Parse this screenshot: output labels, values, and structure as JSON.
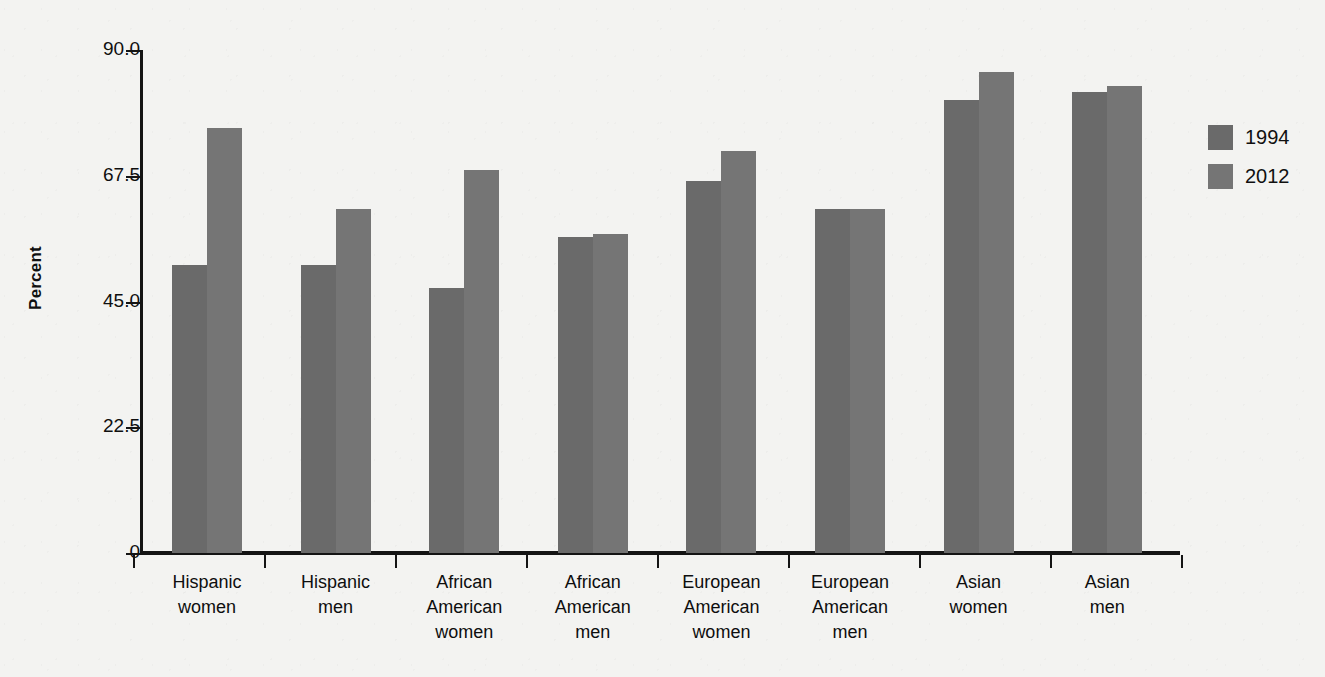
{
  "chart_data": {
    "type": "bar",
    "title": "",
    "xlabel": "",
    "ylabel": "Percent",
    "ylim": [
      0,
      90
    ],
    "yticks": [
      "0",
      "22.5",
      "45.0",
      "67.5",
      "90.0"
    ],
    "ytick_values": [
      0,
      22.5,
      45.0,
      67.5,
      90.0
    ],
    "grid": false,
    "legend_position": "right",
    "categories": [
      "Hispanic women",
      "Hispanic men",
      "African American women",
      "African American men",
      "European American women",
      "European American men",
      "Asian women",
      "Asian men"
    ],
    "category_lines": [
      [
        "Hispanic",
        "women"
      ],
      [
        "Hispanic",
        "men"
      ],
      [
        "African",
        "American",
        "women"
      ],
      [
        "African",
        "American",
        "men"
      ],
      [
        "European",
        "American",
        "women"
      ],
      [
        "European",
        "American",
        "men"
      ],
      [
        "Asian",
        "women"
      ],
      [
        "Asian",
        "men"
      ]
    ],
    "series": [
      {
        "name": "1994",
        "color": "#6a6a6a",
        "values": [
          51.5,
          51.5,
          47.5,
          56.5,
          66.5,
          61.5,
          81.0,
          82.5
        ]
      },
      {
        "name": "2012",
        "color": "#757575",
        "values": [
          76.0,
          61.5,
          68.5,
          57.0,
          72.0,
          61.5,
          86.0,
          83.5
        ]
      }
    ]
  },
  "legend": {
    "items": [
      {
        "label": "1994",
        "color": "#6a6a6a"
      },
      {
        "label": "2012",
        "color": "#757575"
      }
    ]
  },
  "axes": {
    "y_title": "Percent",
    "y_tick_labels": [
      "90.0",
      "67.5",
      "45.0",
      "22.5",
      "0"
    ]
  },
  "colors": {
    "background": "#f3f3f1",
    "axis": "#141414",
    "text": "#0f0f0f",
    "series_1994": "#6a6a6a",
    "series_2012": "#757575"
  }
}
